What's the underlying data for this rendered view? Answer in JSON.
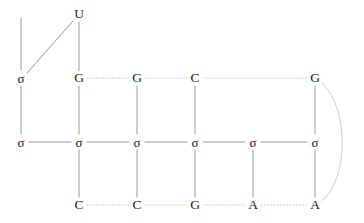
{
  "diagram": {
    "type": "rna-secondary-structure-lattice",
    "background_color": "#ffffff",
    "label_color": "#1a1a1a",
    "edge_color_solid": "#9a9a9a",
    "edge_color_dotted": "#c8c8c8",
    "edge_color_arc": "#cfcfcf",
    "width": 364,
    "height": 223,
    "rows": {
      "top_y": 78,
      "middle_y": 142,
      "bottom_y": 205,
      "apex_y": 14
    },
    "columns_x": [
      21,
      79,
      137,
      195,
      253,
      315
    ],
    "nodes": [
      {
        "id": "apex-u",
        "label": "U",
        "kind": "base",
        "x": 79,
        "y": 14
      },
      {
        "id": "top-0",
        "label": "σ",
        "kind": "sigma",
        "x": 21,
        "y": 78
      },
      {
        "id": "top-1",
        "label": "G",
        "kind": "base",
        "x": 79,
        "y": 78
      },
      {
        "id": "top-2",
        "label": "G",
        "kind": "base",
        "x": 137,
        "y": 78
      },
      {
        "id": "top-3",
        "label": "C",
        "kind": "base",
        "x": 195,
        "y": 78
      },
      {
        "id": "top-5",
        "label": "G",
        "kind": "base",
        "x": 315,
        "y": 78
      },
      {
        "id": "mid-0",
        "label": "σ",
        "kind": "sigma",
        "x": 21,
        "y": 142
      },
      {
        "id": "mid-1",
        "label": "σ",
        "kind": "sigma",
        "x": 79,
        "y": 142
      },
      {
        "id": "mid-2",
        "label": "σ",
        "kind": "sigma",
        "x": 137,
        "y": 142
      },
      {
        "id": "mid-3",
        "label": "σ",
        "kind": "sigma",
        "x": 195,
        "y": 142
      },
      {
        "id": "mid-4",
        "label": "σ",
        "kind": "sigma",
        "x": 253,
        "y": 142
      },
      {
        "id": "mid-5",
        "label": "σ",
        "kind": "sigma",
        "x": 315,
        "y": 142
      },
      {
        "id": "bot-1",
        "label": "C",
        "kind": "base",
        "x": 79,
        "y": 205
      },
      {
        "id": "bot-2",
        "label": "C",
        "kind": "base",
        "x": 137,
        "y": 205
      },
      {
        "id": "bot-3",
        "label": "G",
        "kind": "base",
        "x": 195,
        "y": 205
      },
      {
        "id": "bot-4",
        "label": "A",
        "kind": "base",
        "x": 253,
        "y": 205
      },
      {
        "id": "bot-5",
        "label": "A",
        "kind": "base",
        "x": 315,
        "y": 205
      }
    ],
    "edges": {
      "solid": [
        {
          "id": "edge-stub-top-left",
          "from": "stub",
          "to": "top-0",
          "x1": 21,
          "y1": 18,
          "x2": 21,
          "y2": 70
        },
        {
          "id": "edge-u-to-sigma-diagonal",
          "from": "apex-u",
          "to": "top-0",
          "x1": 73,
          "y1": 21,
          "x2": 27,
          "y2": 73
        },
        {
          "id": "edge-u-to-g-vertical",
          "from": "apex-u",
          "to": "top-1",
          "x1": 79,
          "y1": 22,
          "x2": 79,
          "y2": 71
        },
        {
          "id": "edge-mid-0-1",
          "from": "mid-0",
          "to": "mid-1",
          "x1": 29,
          "y1": 142,
          "x2": 71,
          "y2": 142
        },
        {
          "id": "edge-mid-1-2",
          "from": "mid-1",
          "to": "mid-2",
          "x1": 87,
          "y1": 142,
          "x2": 129,
          "y2": 142
        },
        {
          "id": "edge-mid-2-3",
          "from": "mid-2",
          "to": "mid-3",
          "x1": 145,
          "y1": 142,
          "x2": 187,
          "y2": 142
        },
        {
          "id": "edge-mid-3-4",
          "from": "mid-3",
          "to": "mid-4",
          "x1": 203,
          "y1": 142,
          "x2": 245,
          "y2": 142
        },
        {
          "id": "edge-mid-4-5",
          "from": "mid-4",
          "to": "mid-5",
          "x1": 261,
          "y1": 142,
          "x2": 307,
          "y2": 142
        },
        {
          "id": "edge-col0-vert",
          "from": "top-0",
          "to": "mid-0",
          "x1": 21,
          "y1": 86,
          "x2": 21,
          "y2": 134
        },
        {
          "id": "edge-col1-vert-top",
          "from": "top-1",
          "to": "mid-1",
          "x1": 79,
          "y1": 86,
          "x2": 79,
          "y2": 134
        },
        {
          "id": "edge-col2-vert-top",
          "from": "top-2",
          "to": "mid-2",
          "x1": 137,
          "y1": 86,
          "x2": 137,
          "y2": 134
        },
        {
          "id": "edge-col3-vert-top",
          "from": "top-3",
          "to": "mid-3",
          "x1": 195,
          "y1": 86,
          "x2": 195,
          "y2": 134
        },
        {
          "id": "edge-col5-vert-top",
          "from": "top-5",
          "to": "mid-5",
          "x1": 315,
          "y1": 86,
          "x2": 315,
          "y2": 134
        },
        {
          "id": "edge-col1-vert-bot",
          "from": "mid-1",
          "to": "bot-1",
          "x1": 79,
          "y1": 150,
          "x2": 79,
          "y2": 197
        },
        {
          "id": "edge-col2-vert-bot",
          "from": "mid-2",
          "to": "bot-2",
          "x1": 137,
          "y1": 150,
          "x2": 137,
          "y2": 197
        },
        {
          "id": "edge-col3-vert-bot",
          "from": "mid-3",
          "to": "bot-3",
          "x1": 195,
          "y1": 150,
          "x2": 195,
          "y2": 197
        },
        {
          "id": "edge-col4-vert-bot",
          "from": "mid-4",
          "to": "bot-4",
          "x1": 253,
          "y1": 150,
          "x2": 253,
          "y2": 197
        },
        {
          "id": "edge-col5-vert-bot",
          "from": "mid-5",
          "to": "bot-5",
          "x1": 315,
          "y1": 150,
          "x2": 315,
          "y2": 197
        }
      ],
      "dotted": [
        {
          "id": "edge-top-1-2",
          "from": "top-1",
          "to": "top-2",
          "x1": 87,
          "y1": 78,
          "x2": 129,
          "y2": 78
        },
        {
          "id": "edge-top-2-3",
          "from": "top-2",
          "to": "top-3",
          "x1": 145,
          "y1": 78,
          "x2": 187,
          "y2": 78
        },
        {
          "id": "edge-top-3-5",
          "from": "top-3",
          "to": "top-5",
          "x1": 203,
          "y1": 78,
          "x2": 307,
          "y2": 78
        },
        {
          "id": "edge-bot-1-2",
          "from": "bot-1",
          "to": "bot-2",
          "x1": 87,
          "y1": 205,
          "x2": 129,
          "y2": 205
        },
        {
          "id": "edge-bot-2-3",
          "from": "bot-2",
          "to": "bot-3",
          "x1": 145,
          "y1": 205,
          "x2": 187,
          "y2": 205
        },
        {
          "id": "edge-bot-3-4",
          "from": "bot-3",
          "to": "bot-4",
          "x1": 203,
          "y1": 205,
          "x2": 245,
          "y2": 205
        },
        {
          "id": "edge-bot-4-5",
          "from": "bot-4",
          "to": "bot-5",
          "x1": 261,
          "y1": 205,
          "x2": 307,
          "y2": 205
        }
      ],
      "arc": [
        {
          "id": "edge-arc-g-to-a",
          "from": "top-5",
          "to": "bot-5",
          "path": "M 322 83 C 349 108, 349 178, 322 201"
        }
      ]
    }
  }
}
